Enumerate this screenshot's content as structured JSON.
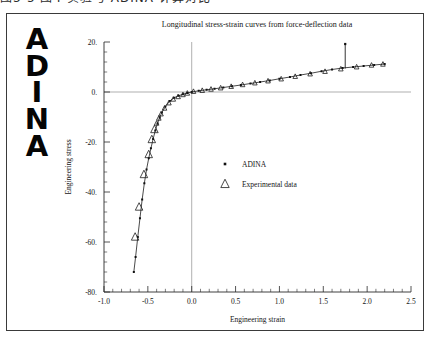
{
  "top_caption": "图3-5 图4 实验与 ADINA 计算对比",
  "logo": {
    "name": "ADINA",
    "letters": [
      "A",
      "D",
      "I",
      "N",
      "A"
    ]
  },
  "chart_data": {
    "type": "line",
    "title": "Longitudinal stress-strain curves from force-deflection data",
    "xlabel": "Engineering strain",
    "ylabel": "Engineering stress",
    "xlim": [
      -1.0,
      2.5
    ],
    "ylim": [
      -80.0,
      20.0
    ],
    "xticks": [
      "-1.0",
      "-0.5",
      "0.0",
      "0.5",
      "1.0",
      "1.5",
      "2.0",
      "2.5"
    ],
    "xtick_values": [
      -1.0,
      -0.5,
      0.0,
      0.5,
      1.0,
      1.5,
      2.0,
      2.5
    ],
    "yticks": [
      "20.",
      "0.",
      "-20.",
      "-40.",
      "-60.",
      "-80."
    ],
    "ytick_values": [
      20,
      0,
      -20,
      -40,
      -60,
      -80
    ],
    "minor_ticks_per_interval": 4,
    "grid": "reference-lines-at-x0-and-y0",
    "legend_position": "center",
    "series": [
      {
        "name": "ADINA",
        "marker": "dot",
        "x": [
          -0.66,
          -0.64,
          -0.615,
          -0.59,
          -0.565,
          -0.54,
          -0.515,
          -0.49,
          -0.465,
          -0.44,
          -0.415,
          -0.39,
          -0.365,
          -0.34,
          -0.3,
          -0.25,
          -0.2,
          -0.15,
          -0.1,
          -0.05,
          0.0,
          0.08,
          0.17,
          0.26,
          0.36,
          0.46,
          0.56,
          0.67,
          0.78,
          0.89,
          1.0,
          1.12,
          1.24,
          1.36,
          1.48,
          1.6,
          1.72,
          1.84,
          1.96,
          2.08,
          2.2
        ],
        "y": [
          -72.0,
          -66.0,
          -58.0,
          -50.5,
          -43.0,
          -36.5,
          -31.0,
          -26.5,
          -22.5,
          -18.8,
          -15.4,
          -12.6,
          -10.2,
          -8.2,
          -5.8,
          -3.6,
          -2.3,
          -1.5,
          -0.9,
          -0.4,
          0.0,
          0.5,
          0.9,
          1.3,
          1.8,
          2.3,
          2.8,
          3.4,
          4.0,
          4.6,
          5.3,
          6.0,
          6.8,
          7.5,
          8.3,
          9.0,
          9.6,
          10.0,
          10.4,
          10.8,
          11.2
        ]
      },
      {
        "name": "Experimental data",
        "marker": "triangle",
        "x": [
          -0.645,
          -0.6,
          -0.545,
          -0.49,
          -0.455,
          -0.425,
          -0.4,
          -0.375,
          -0.35,
          -0.31,
          -0.26,
          -0.21,
          -0.155,
          -0.1,
          -0.05,
          0.02,
          0.12,
          0.22,
          0.33,
          0.45,
          0.58,
          0.72,
          0.87,
          1.02,
          1.18,
          1.35,
          1.52,
          1.7,
          1.88,
          2.05,
          2.18
        ],
        "y": [
          -58.0,
          -46.0,
          -33.0,
          -25.0,
          -19.0,
          -15.0,
          -12.5,
          -10.5,
          -8.8,
          -6.5,
          -4.4,
          -2.9,
          -1.9,
          -1.1,
          -0.5,
          0.2,
          0.6,
          1.1,
          1.6,
          2.2,
          2.9,
          3.6,
          4.4,
          5.2,
          6.2,
          7.2,
          8.2,
          9.2,
          10.0,
          10.7,
          11.1
        ]
      }
    ],
    "annotation": {
      "name": "vertical-spike",
      "x": 1.75,
      "y_from": 9.4,
      "y_to": 19.2
    },
    "legend": [
      {
        "label": "ADINA",
        "marker": "dot"
      },
      {
        "label": "Experimental data",
        "marker": "triangle"
      }
    ]
  }
}
